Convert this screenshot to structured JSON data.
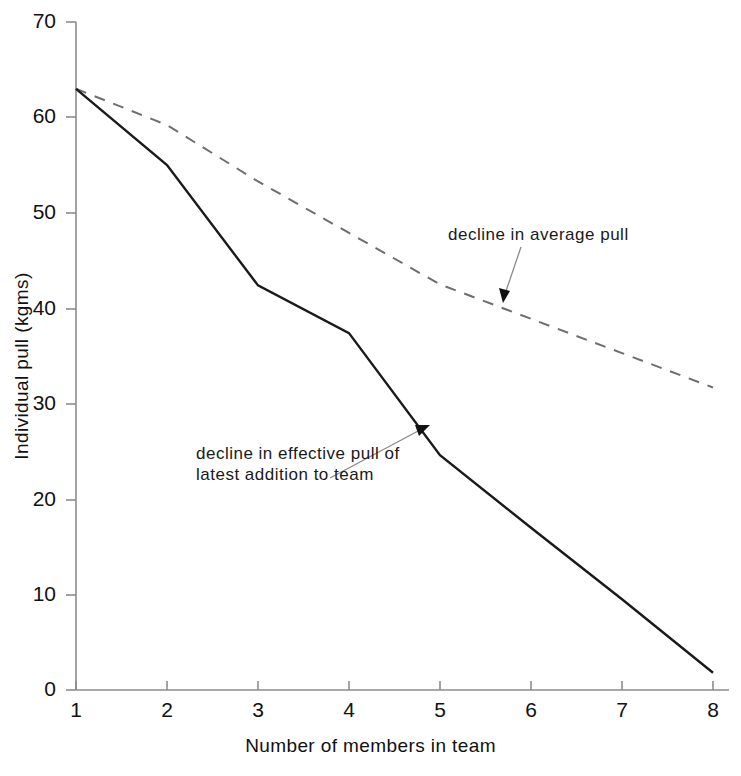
{
  "chart_data": {
    "type": "line",
    "title": "",
    "xlabel": "Number of members in team",
    "ylabel": "Individual pull (kgms)",
    "xlim": [
      1,
      8
    ],
    "ylim": [
      0,
      70
    ],
    "x": [
      1,
      2,
      3,
      4,
      5,
      6,
      7,
      8
    ],
    "xticks": [
      "1",
      "2",
      "3",
      "4",
      "5",
      "6",
      "7",
      "8"
    ],
    "yticks": [
      "0",
      "10",
      "20",
      "30",
      "40",
      "50",
      "60",
      "70"
    ],
    "grid": false,
    "legend_position": "none",
    "series": [
      {
        "name": "decline in average pull",
        "style": "dashed",
        "color": "#555555",
        "values": [
          63,
          59.2,
          53.3,
          47.9,
          42.5,
          38.9,
          35.3,
          31.7
        ]
      },
      {
        "name": "decline in effective pull of latest addition to team",
        "style": "solid",
        "color": "#1a1a1a",
        "values": [
          63,
          55,
          42.4,
          37.4,
          24.6,
          17,
          9.5,
          1.8
        ]
      }
    ],
    "annotations": [
      {
        "id": "average-pull",
        "text": "decline in average pull",
        "target_x": 5.7,
        "target_y": 41.5
      },
      {
        "id": "effective-pull",
        "line1": "decline in effective pull of",
        "line2": "latest addition to team",
        "target_x": 4.7,
        "target_y": 28.5
      }
    ]
  },
  "axes": {
    "y_title": "Individual pull (kgms)",
    "x_title": "Number of members in team",
    "y_tick_labels": [
      "70",
      "60",
      "50",
      "40",
      "30",
      "20",
      "10",
      "0"
    ],
    "x_tick_labels": [
      "1",
      "2",
      "3",
      "4",
      "5",
      "6",
      "7",
      "8"
    ]
  },
  "annotations": {
    "average_pull": "decline in average pull",
    "effective_pull_line1": "decline in effective pull of",
    "effective_pull_line2": "latest addition to team"
  },
  "colors": {
    "axis": "#8c8c8c",
    "solid_series": "#1a1a1a",
    "dashed_series": "#6e6e6e",
    "text": "#111111",
    "background": "#ffffff"
  }
}
